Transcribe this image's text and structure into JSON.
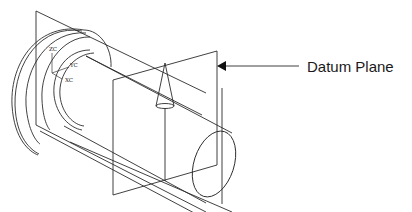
{
  "figure": {
    "callout_label": "Datum Plane",
    "axis_labels": {
      "z": "ZC",
      "y": "YC",
      "x": "XC"
    },
    "line_color": "#2b2b2b",
    "background": "#ffffff"
  }
}
